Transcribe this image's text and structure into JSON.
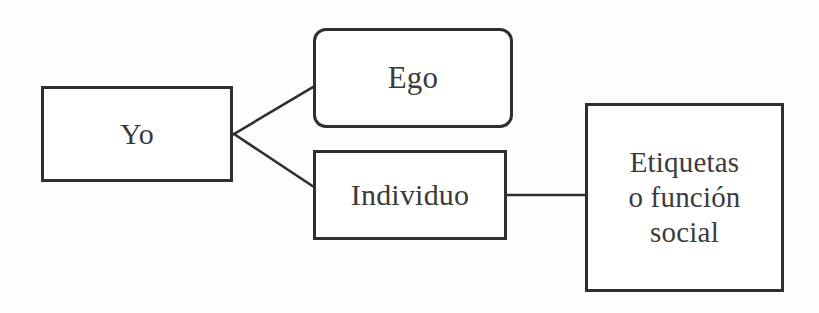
{
  "diagram": {
    "background_color": "#fdfdfd",
    "stroke_color": "#2f2f2f",
    "text_color": "#3b3b3b",
    "nodes": [
      {
        "id": "yo",
        "label": "Yo",
        "shape": "rectangle"
      },
      {
        "id": "ego",
        "label": "Ego",
        "shape": "rounded-rectangle"
      },
      {
        "id": "individuo",
        "label": "Individuo",
        "shape": "rectangle"
      },
      {
        "id": "etiquetas",
        "label": "Etiquetas\no función\nsocial",
        "shape": "rectangle"
      }
    ],
    "edges": [
      {
        "id": "yo-ego",
        "from": "yo",
        "to": "ego",
        "style": "diagonal-line"
      },
      {
        "id": "yo-individuo",
        "from": "yo",
        "to": "individuo",
        "style": "diagonal-line"
      },
      {
        "id": "individuo-etiquetas",
        "from": "individuo",
        "to": "etiquetas",
        "style": "horizontal-line"
      }
    ]
  }
}
